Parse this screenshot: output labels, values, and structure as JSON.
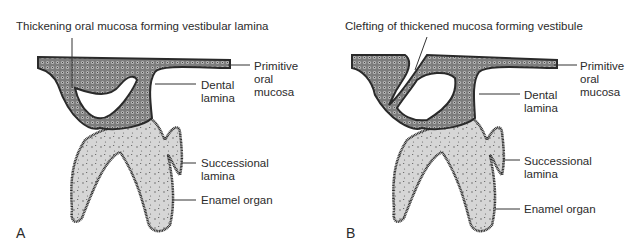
{
  "figure": {
    "panels": [
      {
        "letter": "A",
        "top_label": "Thickening oral mucosa forming vestibular lamina",
        "labels": {
          "primitive": [
            "Primitive",
            "oral",
            "mucosa"
          ],
          "dental": [
            "Dental",
            "lamina"
          ],
          "successional": [
            "Successional",
            "lamina"
          ],
          "enamel": "Enamel organ"
        }
      },
      {
        "letter": "B",
        "top_label": "Clefting of thickened mucosa forming vestibule",
        "labels": {
          "primitive": [
            "Primitive",
            "oral",
            "mucosa"
          ],
          "dental": [
            "Dental",
            "lamina"
          ],
          "successional": [
            "Successional",
            "lamina"
          ],
          "enamel": "Enamel organ"
        }
      }
    ],
    "colors": {
      "mucosa_fill": "#8a8a8a",
      "enamel_fill": "#d4d4d4",
      "outline": "#2a2a2a"
    }
  }
}
